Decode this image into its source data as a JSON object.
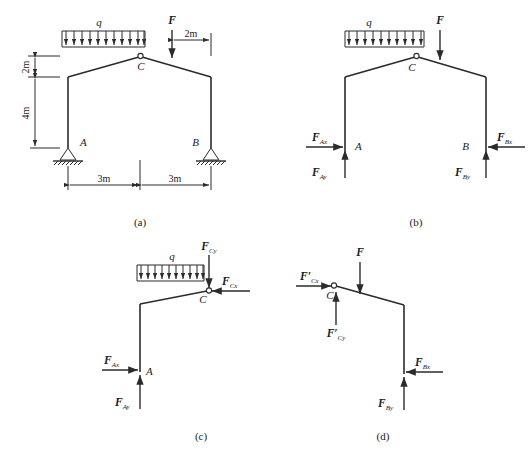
{
  "figure": {
    "type": "engineering-free-body-diagram",
    "stroke_color": "#2b2b2b",
    "background": "#ffffff"
  },
  "panels": [
    {
      "id": "a",
      "caption": "(a)",
      "kind": "structure",
      "loads": {
        "distributed": "q",
        "point": "F"
      },
      "joints": {
        "left_support": "A",
        "right_support": "B",
        "hinge": "C"
      },
      "dimensions": {
        "height_upper": "2m",
        "height_lower": "4m",
        "span_left": "3m",
        "span_right": "3m",
        "load_offset": "2m"
      }
    },
    {
      "id": "b",
      "caption": "(b)",
      "kind": "whole-frame-free-body",
      "loads": {
        "distributed": "q",
        "point": "F"
      },
      "joints": {
        "left_support": "A",
        "right_support": "B",
        "hinge": "C"
      },
      "reactions": [
        {
          "name": "F_Ax",
          "base": "F",
          "sub": "Ax",
          "dir": "right"
        },
        {
          "name": "F_Ay",
          "base": "F",
          "sub": "Ay",
          "dir": "up"
        },
        {
          "name": "F_Bx",
          "base": "F",
          "sub": "Bx",
          "dir": "left"
        },
        {
          "name": "F_By",
          "base": "F",
          "sub": "By",
          "dir": "up"
        }
      ]
    },
    {
      "id": "c",
      "caption": "(c)",
      "kind": "left-half-free-body",
      "loads": {
        "distributed": "q"
      },
      "joints": {
        "support": "A",
        "hinge": "C"
      },
      "reactions": [
        {
          "name": "F_Cy",
          "base": "F",
          "sub": "Cy",
          "dir": "down"
        },
        {
          "name": "F_Cx",
          "base": "F",
          "sub": "Cx",
          "dir": "left"
        },
        {
          "name": "F_Ax",
          "base": "F",
          "sub": "Ax",
          "dir": "right"
        },
        {
          "name": "F_Ay",
          "base": "F",
          "sub": "Ay",
          "dir": "up"
        }
      ]
    },
    {
      "id": "d",
      "caption": "(d)",
      "kind": "right-half-free-body",
      "loads": {
        "point": "F"
      },
      "joints": {
        "support": "B",
        "hinge": "C"
      },
      "reactions": [
        {
          "name": "F'_Cx",
          "base": "F",
          "prime": "′",
          "sub": "Cx",
          "dir": "right"
        },
        {
          "name": "F'_Cy",
          "base": "F",
          "prime": "′",
          "sub": "Cy",
          "dir": "up"
        },
        {
          "name": "F_Bx",
          "base": "F",
          "sub": "Bx",
          "dir": "left"
        },
        {
          "name": "F_By",
          "base": "F",
          "sub": "By",
          "dir": "up"
        }
      ]
    }
  ],
  "labels": {
    "q": "q",
    "F": "F",
    "A": "A",
    "B": "B",
    "C": "C",
    "F_base": "F",
    "prime": "′",
    "sub_Ax": "Ax",
    "sub_Ay": "Ay",
    "sub_Bx": "Bx",
    "sub_By": "By",
    "sub_Cx": "Cx",
    "sub_Cy": "Cy",
    "dim_2m": "2m",
    "dim_4m": "4m",
    "dim_3m_left": "3m",
    "dim_3m_right": "3m",
    "dim_2m_offset": "2m",
    "cap_a": "(a)",
    "cap_b": "(b)",
    "cap_c": "(c)",
    "cap_d": "(d)"
  }
}
